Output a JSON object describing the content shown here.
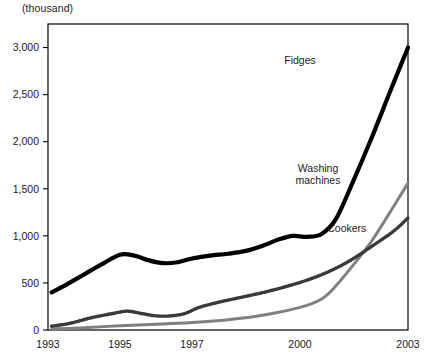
{
  "chart_data": {
    "type": "line",
    "title": "",
    "unit_note": "(thousand)",
    "xlabel": "",
    "ylabel": "",
    "ylim": [
      0,
      3250
    ],
    "yticks": [
      0,
      500,
      1000,
      1500,
      2000,
      2500,
      3000
    ],
    "ytick_labels": [
      "0",
      "500",
      "1,000",
      "1,500",
      "2,000",
      "2,500",
      "3,000"
    ],
    "xlim": [
      1993,
      2003
    ],
    "xticks": [
      1993,
      1995,
      1997,
      2000,
      2003
    ],
    "xtick_labels": [
      "1993",
      "1995",
      "1997",
      "2000",
      "2003"
    ],
    "grid": false,
    "legend_position": "inline-annotations",
    "series": [
      {
        "name": "Fidges",
        "color": "#000000",
        "style": "solid-thick",
        "label_x": 2000.0,
        "label_y": 2820,
        "x": [
          1993.1,
          1993.5,
          1994.0,
          1994.5,
          1995.0,
          1995.4,
          1995.8,
          1996.2,
          1996.6,
          1997.0,
          1997.5,
          1998.0,
          1998.5,
          1999.0,
          1999.4,
          1999.8,
          2000.2,
          2000.6,
          2001.0,
          2001.5,
          2002.0,
          2002.5,
          2003.0
        ],
        "values": [
          400,
          480,
          590,
          700,
          800,
          790,
          740,
          710,
          720,
          760,
          790,
          810,
          840,
          900,
          960,
          1000,
          990,
          1020,
          1180,
          1600,
          2050,
          2530,
          3000
        ]
      },
      {
        "name": "Washing machines",
        "color": "#808080",
        "style": "solid-medium",
        "label_x": 2000.5,
        "label_y": 1680,
        "label_lines": [
          "Washing",
          "machines"
        ],
        "x": [
          1993.1,
          1994.0,
          1995.0,
          1996.0,
          1997.0,
          1998.0,
          1999.0,
          2000.0,
          2000.6,
          2001.0,
          2001.5,
          2002.0,
          2002.5,
          2003.0
        ],
        "values": [
          10,
          25,
          45,
          60,
          80,
          110,
          160,
          240,
          330,
          470,
          700,
          950,
          1250,
          1560
        ]
      },
      {
        "name": "Cookers",
        "color": "#3a3a3a",
        "style": "dotted-thick",
        "label_x": 2001.3,
        "label_y": 1040,
        "x": [
          1993.1,
          1993.6,
          1994.2,
          1994.8,
          1995.2,
          1995.6,
          1996.0,
          1996.4,
          1996.8,
          1997.2,
          1997.8,
          1998.4,
          1999.0,
          1999.6,
          2000.2,
          2000.8,
          2001.4,
          2002.0,
          2002.6,
          2003.0
        ],
        "values": [
          40,
          70,
          130,
          175,
          200,
          175,
          150,
          150,
          175,
          240,
          300,
          350,
          400,
          460,
          530,
          620,
          740,
          890,
          1050,
          1190
        ]
      }
    ]
  }
}
